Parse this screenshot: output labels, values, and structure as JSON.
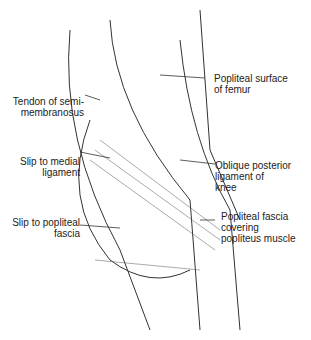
{
  "labels": {
    "popliteal_surface": [
      "Popliteal surface",
      "of femur"
    ],
    "semimembranosus": [
      "Tendon of semi-",
      "membranosus"
    ],
    "medial_slip": [
      "Slip to medial",
      "ligament"
    ],
    "oblique": [
      "Oblique posterior",
      "ligament of",
      "knee"
    ],
    "popliteal_slip": [
      "Slip to popliteal",
      "fascia"
    ],
    "fascia": [
      "Popliteal fascia",
      "covering",
      "popliteus muscle"
    ]
  }
}
